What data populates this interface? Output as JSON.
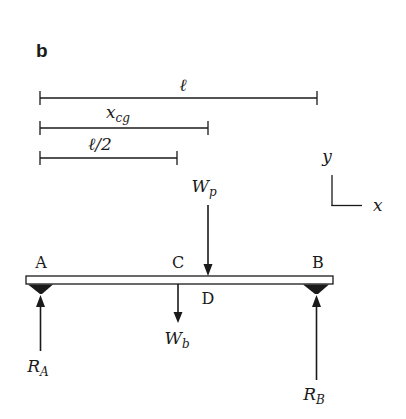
{
  "panel_label": "b",
  "dimensions": {
    "length": {
      "label": "ℓ"
    },
    "x_cg": {
      "label_main": "x",
      "label_sub": "cg"
    },
    "half_length": {
      "label": "ℓ/2"
    }
  },
  "axes": {
    "y_label": "y",
    "x_label": "x"
  },
  "points": {
    "A": "A",
    "B": "B",
    "C": "C",
    "D": "D"
  },
  "forces": {
    "Wp": {
      "main": "W",
      "sub": "p"
    },
    "Wb": {
      "main": "W",
      "sub": "b"
    },
    "RA": {
      "main": "R",
      "sub": "A"
    },
    "RB": {
      "main": "R",
      "sub": "B"
    }
  },
  "colors": {
    "ink": "#1a1a1a",
    "background": "#ffffff"
  }
}
